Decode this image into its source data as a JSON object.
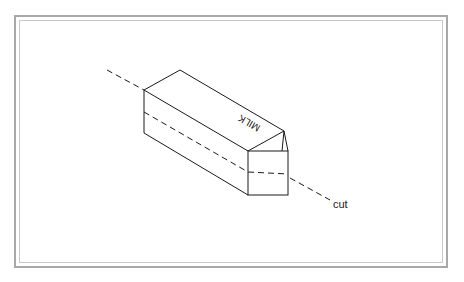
{
  "diagram": {
    "carton_label": "MILK",
    "cut_label": "cut",
    "line_color": "#1a1a1a",
    "frame_color": "#a8a8a8"
  }
}
